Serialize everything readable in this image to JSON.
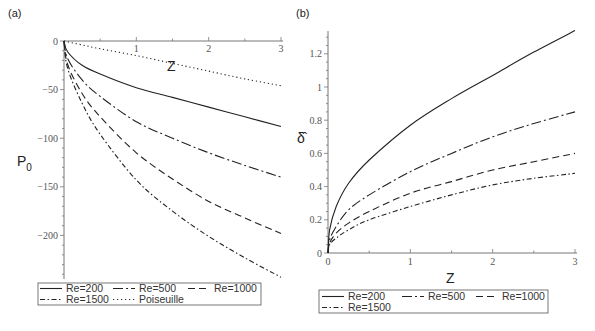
{
  "chart_data": [
    {
      "type": "line",
      "panel_label": "(a)",
      "xlabel": "Z",
      "ylabel": "P",
      "ylabel_sub": "0",
      "xlim": [
        0,
        3
      ],
      "ylim": [
        -250,
        0
      ],
      "xticks": [
        1,
        2,
        3
      ],
      "yticks": [
        0,
        -50,
        -100,
        -150,
        -200
      ],
      "grid": false,
      "legend_position": "bottom",
      "x": [
        0,
        0.05,
        0.25,
        0.5,
        1,
        1.5,
        2,
        2.5,
        3
      ],
      "series": [
        {
          "name": "Re=200",
          "style": "solid",
          "values": [
            0,
            -11,
            -25,
            -34,
            -48,
            -58,
            -68,
            -78,
            -88
          ]
        },
        {
          "name": "Re=500",
          "style": "long-dash-dot",
          "values": [
            0,
            -18,
            -40,
            -57,
            -83,
            -100,
            -115,
            -128,
            -140
          ]
        },
        {
          "name": "Re=1000",
          "style": "dash",
          "values": [
            0,
            -24,
            -54,
            -78,
            -115,
            -142,
            -165,
            -182,
            -198
          ]
        },
        {
          "name": "Re=1500",
          "style": "dash-dot",
          "values": [
            0,
            -28,
            -64,
            -96,
            -143,
            -175,
            -201,
            -223,
            -243
          ]
        },
        {
          "name": "Poiseuille",
          "style": "dot",
          "values": [
            0,
            -1,
            -4,
            -8,
            -15,
            -23,
            -31,
            -39,
            -46
          ]
        }
      ]
    },
    {
      "type": "line",
      "panel_label": "(b)",
      "xlabel": "Z",
      "ylabel": "δ̂",
      "xlim": [
        0,
        3
      ],
      "ylim": [
        0,
        1.35
      ],
      "xticks": [
        0,
        1,
        2,
        3
      ],
      "yticks": [
        0,
        0.2,
        0.4,
        0.6,
        0.8,
        1,
        1.2
      ],
      "grid": false,
      "legend_position": "bottom",
      "x": [
        0,
        0.02,
        0.1,
        0.25,
        0.5,
        1,
        1.5,
        2,
        2.5,
        3
      ],
      "series": [
        {
          "name": "Re=200",
          "style": "solid",
          "values": [
            0,
            0.14,
            0.28,
            0.42,
            0.56,
            0.77,
            0.93,
            1.07,
            1.21,
            1.34
          ]
        },
        {
          "name": "Re=500",
          "style": "long-dash-dot",
          "values": [
            0,
            0.08,
            0.16,
            0.26,
            0.35,
            0.49,
            0.6,
            0.7,
            0.78,
            0.85
          ]
        },
        {
          "name": "Re=1000",
          "style": "dash",
          "values": [
            0,
            0.06,
            0.12,
            0.18,
            0.25,
            0.36,
            0.43,
            0.5,
            0.55,
            0.6
          ]
        },
        {
          "name": "Re=1500",
          "style": "dash-dot",
          "values": [
            0,
            0.05,
            0.09,
            0.14,
            0.2,
            0.28,
            0.35,
            0.41,
            0.45,
            0.48
          ]
        }
      ]
    }
  ],
  "legend_a": {
    "row1": [
      "Re=200",
      "Re=500",
      "Re=1000"
    ],
    "row2": [
      "Re=1500",
      "Poiseuille"
    ]
  },
  "legend_b": {
    "row1": [
      "Re=200",
      "Re=500",
      "Re=1000"
    ],
    "row2": [
      "Re=1500"
    ]
  }
}
